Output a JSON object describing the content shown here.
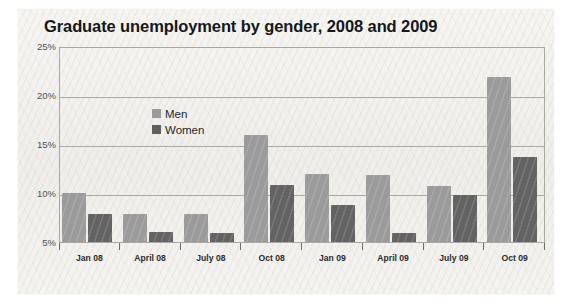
{
  "chart_data": {
    "type": "bar",
    "title": "Graduate unemployment by gender, 2008 and 2009",
    "xlabel": "",
    "ylabel": "",
    "ylim": [
      5,
      25
    ],
    "grid": true,
    "legend_position": "upper-left inside plot",
    "ytick_labels": [
      "25%",
      "20%",
      "15%",
      "10%",
      "5%"
    ],
    "ytick_values": [
      25,
      20,
      15,
      10,
      5
    ],
    "categories": [
      "Jan 08",
      "April 08",
      "July 08",
      "Oct 08",
      "Jan 09",
      "April 09",
      "July 09",
      "Oct 09"
    ],
    "series": [
      {
        "name": "Men",
        "color": "#9b9b9b",
        "values": [
          10.0,
          7.9,
          7.9,
          15.9,
          11.9,
          11.8,
          10.7,
          21.8
        ]
      },
      {
        "name": "Women",
        "color": "#636363",
        "values": [
          7.9,
          6.0,
          5.9,
          10.8,
          8.8,
          5.9,
          9.8,
          13.7
        ]
      }
    ]
  },
  "legend": {
    "items": [
      {
        "label": "Men",
        "swatch": "men-swatch"
      },
      {
        "label": "Women",
        "swatch": "women-swatch"
      }
    ]
  },
  "colors": {
    "men": "#9b9b9b",
    "women": "#636363",
    "axis": "#a9a9a5",
    "title_text": "#16171a",
    "page_background": "#f3f2ee"
  }
}
